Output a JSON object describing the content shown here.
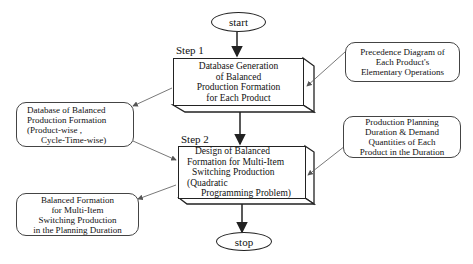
{
  "flowchart": {
    "start": {
      "label": "start"
    },
    "stop": {
      "label": "stop"
    },
    "steps": [
      {
        "label": "Step 1",
        "box_lines": [
          "Database Generation",
          "of  Balanced",
          "Production Formation",
          "for Each Product"
        ]
      },
      {
        "label": "Step 2",
        "box_lines": [
          "Design of Balanced",
          "Formation for  Multi-Item",
          "Switching  Production",
          "(Quadratic",
          "Programming Problem)"
        ]
      }
    ],
    "inputs_outputs": [
      {
        "id": "precedence-diagram",
        "lines": [
          "Precedence Diagram of",
          "Each Product's",
          "Elementary Operations"
        ]
      },
      {
        "id": "balanced-formation-database",
        "lines": [
          "Database of  Balanced",
          "Production  Formation",
          "(Product-wise ,",
          "Cycle-Time-wise)"
        ]
      },
      {
        "id": "planning-duration-demand",
        "lines": [
          "Production Planning",
          "Duration & Demand",
          "Quantities of Each",
          "Product in the Duration"
        ]
      },
      {
        "id": "balanced-formation-output",
        "lines": [
          "Balanced  Formation",
          "for Multi-Item",
          "Switching  Production",
          "in the Planning Duration"
        ]
      }
    ],
    "colors": {
      "stroke": "#222222",
      "connector": "#555555",
      "background": "#ffffff"
    }
  }
}
